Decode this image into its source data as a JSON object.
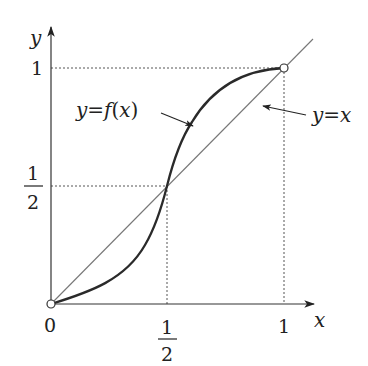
{
  "figure": {
    "type": "function-graph",
    "axes": {
      "x_label": "x",
      "y_label": "y",
      "origin_label": "0"
    },
    "x_ticks": [
      {
        "value": 0.5,
        "numerator": "1",
        "denominator": "2"
      },
      {
        "value": 1,
        "label": "1"
      }
    ],
    "y_ticks": [
      {
        "value": 0.5,
        "numerator": "1",
        "denominator": "2"
      },
      {
        "value": 1,
        "label": "1"
      }
    ],
    "curves": [
      {
        "name": "f",
        "label": "y=f(x)",
        "style": "thick",
        "color": "#2a2a2a",
        "description": "S-shaped curve from (0,0) through (1/2,1/2) to (1,1), below y=x on (0,1/2), above on (1/2,1)"
      },
      {
        "name": "identity",
        "label": "y=x",
        "style": "thin",
        "color": "#777777"
      }
    ],
    "marked_points": [
      {
        "x": 0,
        "y": 0,
        "style": "open-circle"
      },
      {
        "x": 1,
        "y": 1,
        "style": "open-circle"
      },
      {
        "x": 0.5,
        "y": 0.5,
        "style": "intersection"
      }
    ],
    "guides": [
      {
        "from": [
          0,
          1
        ],
        "to": [
          1,
          1
        ],
        "style": "dotted"
      },
      {
        "from": [
          1,
          0
        ],
        "to": [
          1,
          1
        ],
        "style": "dotted"
      },
      {
        "from": [
          0,
          0.5
        ],
        "to": [
          0.5,
          0.5
        ],
        "style": "dotted"
      },
      {
        "from": [
          0.5,
          0
        ],
        "to": [
          0.5,
          0.5
        ],
        "style": "dotted"
      }
    ],
    "labels": {
      "f_curve": {
        "y": "y",
        "eq": "=",
        "f": "f",
        "open": "(",
        "x": "x",
        "close": ")"
      },
      "identity_line": {
        "y": "y",
        "eq": "=",
        "x": "x"
      }
    }
  }
}
